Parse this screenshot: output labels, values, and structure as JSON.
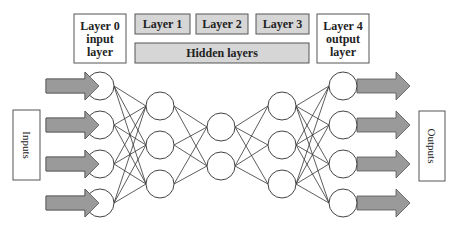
{
  "diagram": {
    "layer_labels": [
      {
        "id": "layer0",
        "lines": [
          "Layer 0",
          "input",
          "layer"
        ],
        "x": 74,
        "y": 14,
        "w": 52,
        "h": 49,
        "fill": "#ffffff"
      },
      {
        "id": "layer1",
        "lines": [
          "Layer 1"
        ],
        "x": 135,
        "y": 14,
        "w": 55,
        "h": 20,
        "fill": "#d6d6d6"
      },
      {
        "id": "layer2",
        "lines": [
          "Layer 2"
        ],
        "x": 196,
        "y": 14,
        "w": 52,
        "h": 20,
        "fill": "#d6d6d6"
      },
      {
        "id": "layer3",
        "lines": [
          "Layer 3"
        ],
        "x": 256,
        "y": 14,
        "w": 53,
        "h": 20,
        "fill": "#d6d6d6"
      },
      {
        "id": "layer4",
        "lines": [
          "Layer 4",
          "output",
          "layer"
        ],
        "x": 317,
        "y": 14,
        "w": 52,
        "h": 49,
        "fill": "#ffffff"
      }
    ],
    "hidden_label": {
      "text": "Hidden layers",
      "x": 135,
      "y": 43,
      "w": 174,
      "h": 20,
      "fill": "#d6d6d6"
    },
    "inputs_box": {
      "text": "Inputs",
      "x": 13,
      "y": 110,
      "w": 27,
      "h": 70
    },
    "outputs_box": {
      "text": "Outputs",
      "x": 419,
      "y": 111,
      "w": 26,
      "h": 70
    },
    "node_radius": 14,
    "layers": [
      {
        "name": "input",
        "x": 100,
        "ys": [
          86,
          125,
          164,
          203
        ]
      },
      {
        "name": "hidden1",
        "x": 160,
        "ys": [
          106,
          145,
          184
        ]
      },
      {
        "name": "hidden2",
        "x": 221,
        "ys": [
          127,
          166
        ]
      },
      {
        "name": "hidden3",
        "x": 282,
        "ys": [
          106,
          145,
          184
        ]
      },
      {
        "name": "output",
        "x": 343,
        "ys": [
          86,
          125,
          164,
          203
        ]
      }
    ],
    "input_arrows": {
      "x_start": 46,
      "x_end": 99,
      "ys": [
        86,
        125,
        164,
        203
      ]
    },
    "output_arrows": {
      "x_start": 357,
      "x_end": 410,
      "ys": [
        86,
        125,
        164,
        203
      ]
    },
    "colors": {
      "arrow_fill": "#9a9a9a",
      "arrow_stroke": "#555555",
      "node_stroke": "#444444",
      "edge": "#333333",
      "box_stroke": "#555555"
    }
  }
}
